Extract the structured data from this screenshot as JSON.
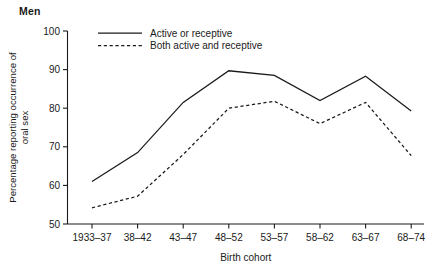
{
  "panel": {
    "title": "Men"
  },
  "chart_data": {
    "type": "line",
    "title": "Men",
    "xlabel": "Birth cohort",
    "ylabel": "Percentage reporting occurrence of oral sex",
    "ylabel_lines": [
      "Percentage reporting occurrence of",
      "oral sex"
    ],
    "categories": [
      "1933–37",
      "38–42",
      "43–47",
      "48–52",
      "53–57",
      "58–62",
      "63–67",
      "68–74"
    ],
    "ylim": [
      50,
      100
    ],
    "yticks": [
      50,
      60,
      70,
      80,
      90,
      100
    ],
    "ytick_labels": [
      "50",
      "60",
      "70",
      "80",
      "90",
      "100"
    ],
    "grid": false,
    "legend_position": "top-center",
    "series": [
      {
        "name": "Active or receptive",
        "style": "solid",
        "color": "#1a1a1a",
        "values": [
          61.0,
          68.5,
          81.5,
          89.7,
          88.5,
          82.0,
          88.3,
          79.3
        ]
      },
      {
        "name": "Both active and receptive",
        "style": "dashed",
        "color": "#1a1a1a",
        "values": [
          54.2,
          57.2,
          68.0,
          80.0,
          81.8,
          76.0,
          81.5,
          67.7
        ]
      }
    ]
  }
}
